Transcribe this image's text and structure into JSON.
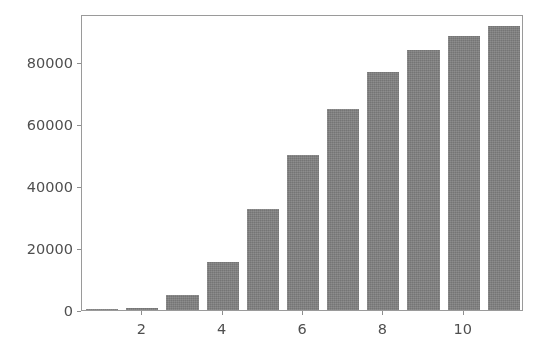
{
  "figure": {
    "background_color": "#ffffff",
    "width": 546,
    "height": 351
  },
  "chart_data": {
    "type": "bar",
    "title": "",
    "subtitle": "",
    "xlabel": "",
    "ylabel": "",
    "categories": [
      1,
      2,
      3,
      4,
      5,
      6,
      7,
      8,
      9,
      10,
      11
    ],
    "x": [
      1,
      2,
      3,
      4,
      5,
      6,
      7,
      8,
      9,
      10,
      11
    ],
    "values": [
      100,
      700,
      5000,
      15400,
      32500,
      50000,
      65000,
      76800,
      84000,
      88500,
      91500
    ],
    "series": [
      {
        "name": "",
        "values": [
          100,
          700,
          5000,
          15400,
          32500,
          50000,
          65000,
          76800,
          84000,
          88500,
          91500
        ]
      }
    ],
    "bar_color": "#808080",
    "bar_width": 0.8,
    "xlim": [
      0.5,
      11.5
    ],
    "ylim": [
      0,
      95500
    ],
    "xticks": [
      2,
      4,
      6,
      8,
      10
    ],
    "xtick_labels": [
      "2",
      "4",
      "6",
      "8",
      "10"
    ],
    "yticks": [
      0,
      20000,
      40000,
      60000,
      80000
    ],
    "ytick_labels": [
      "0",
      "20000",
      "40000",
      "60000",
      "80000"
    ],
    "grid": false,
    "legend": null,
    "legend_position": "none",
    "annotations": [],
    "spines": [
      "left",
      "right",
      "top",
      "bottom"
    ]
  }
}
